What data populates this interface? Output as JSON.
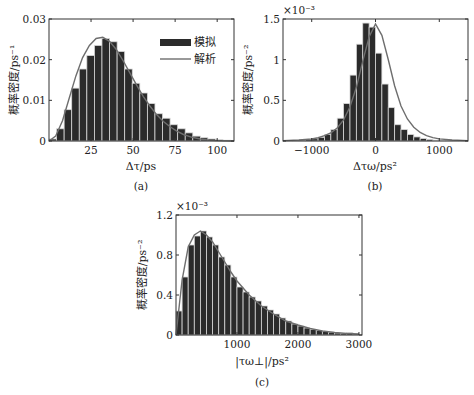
{
  "chart_data": [
    {
      "id": "a",
      "type": "bar",
      "caption": "(a)",
      "xlabel": "Δτ/ps",
      "ylabel": "概率密度/ps⁻¹",
      "xlim": [
        0,
        110
      ],
      "ylim": [
        0,
        0.03
      ],
      "xticks": [
        25,
        50,
        75,
        100
      ],
      "yticks": [
        0,
        0.01,
        0.02,
        0.03
      ],
      "ytick_labels": [
        "0",
        "0.01",
        "0.02",
        "0.03"
      ],
      "multiplier": "",
      "legend": [
        {
          "label": "模拟",
          "kind": "bar"
        },
        {
          "label": "解析",
          "kind": "line"
        }
      ],
      "bin_start": 0,
      "bin_width": 4.5,
      "values": [
        0.0005,
        0.003,
        0.0077,
        0.013,
        0.0177,
        0.021,
        0.0235,
        0.0252,
        0.0244,
        0.022,
        0.0177,
        0.0142,
        0.0118,
        0.0092,
        0.0067,
        0.0056,
        0.004,
        0.003,
        0.002,
        0.0012,
        0.0008,
        0.0005,
        0.0003,
        0.0002
      ],
      "curve": {
        "name": "解析",
        "x": [
          0,
          4,
          8,
          12,
          16,
          20,
          24,
          28,
          32,
          36,
          40,
          44,
          48,
          52,
          56,
          60,
          64,
          68,
          72,
          76,
          80,
          85,
          90,
          95,
          100,
          110
        ],
        "y": [
          0,
          0.0012,
          0.005,
          0.0105,
          0.016,
          0.0205,
          0.0235,
          0.0252,
          0.0255,
          0.0245,
          0.0225,
          0.0198,
          0.0168,
          0.0138,
          0.011,
          0.0086,
          0.0065,
          0.0048,
          0.0035,
          0.0024,
          0.0016,
          0.0009,
          0.0005,
          0.0002,
          0.0001,
          0
        ]
      }
    },
    {
      "id": "b",
      "type": "bar",
      "caption": "(b)",
      "xlabel": "Δτω/ps²",
      "ylabel": "概率密度/ps⁻²",
      "xlim": [
        -1450,
        1450
      ],
      "ylim": [
        0,
        1.5
      ],
      "xticks": [
        -1000,
        0,
        1000
      ],
      "yticks": [
        0,
        0.5,
        1,
        1.5
      ],
      "ytick_labels": [
        "0",
        "0.5",
        "1",
        "1.5"
      ],
      "multiplier": "×10⁻³",
      "bin_start": -1400,
      "bin_width": 100,
      "values": [
        0.005,
        0.008,
        0.012,
        0.018,
        0.028,
        0.045,
        0.08,
        0.14,
        0.28,
        0.46,
        0.81,
        1.19,
        1.45,
        1.4,
        1.08,
        0.7,
        0.41,
        0.2,
        0.14,
        0.08,
        0.05,
        0.03,
        0.02,
        0.01,
        0.007,
        0.005,
        0.003,
        0.002
      ],
      "curve": {
        "name": "解析",
        "x": [
          -1450,
          -1200,
          -1000,
          -900,
          -800,
          -700,
          -600,
          -500,
          -400,
          -300,
          -200,
          -100,
          0,
          100,
          200,
          300,
          400,
          500,
          600,
          700,
          800,
          900,
          1000,
          1200,
          1450
        ],
        "y": [
          0.005,
          0.012,
          0.025,
          0.04,
          0.065,
          0.1,
          0.16,
          0.26,
          0.42,
          0.66,
          0.98,
          1.28,
          1.44,
          1.3,
          1.0,
          0.68,
          0.43,
          0.27,
          0.17,
          0.105,
          0.067,
          0.042,
          0.026,
          0.012,
          0.005
        ]
      }
    },
    {
      "id": "c",
      "type": "bar",
      "caption": "(c)",
      "xlabel": "|τω⊥|/ps²",
      "ylabel": "概率密度/ps⁻²",
      "xlim": [
        0,
        3050
      ],
      "ylim": [
        0,
        1.2
      ],
      "xticks": [
        1000,
        2000,
        3000
      ],
      "yticks": [
        0,
        0.4,
        0.8,
        1.2
      ],
      "ytick_labels": [
        "0",
        "0.4",
        "0.8",
        "1.2"
      ],
      "multiplier": "×10⁻³",
      "bin_start": 0,
      "bin_width": 100,
      "values": [
        0.24,
        0.58,
        0.9,
        0.99,
        1.04,
        0.98,
        0.9,
        0.78,
        0.7,
        0.58,
        0.48,
        0.43,
        0.38,
        0.34,
        0.29,
        0.25,
        0.21,
        0.17,
        0.14,
        0.11,
        0.09,
        0.07,
        0.055,
        0.045,
        0.035,
        0.028,
        0.02,
        0.015,
        0.025,
        0.01
      ],
      "curve": {
        "name": "解析",
        "x": [
          0,
          100,
          200,
          300,
          400,
          500,
          600,
          700,
          800,
          900,
          1000,
          1200,
          1400,
          1600,
          1800,
          2000,
          2200,
          2400,
          2600,
          2800,
          3000
        ],
        "y": [
          0.0,
          0.55,
          0.88,
          1.0,
          1.04,
          1.0,
          0.93,
          0.83,
          0.73,
          0.63,
          0.54,
          0.4,
          0.29,
          0.21,
          0.14,
          0.1,
          0.065,
          0.04,
          0.025,
          0.015,
          0.01
        ]
      }
    }
  ],
  "figure": {
    "bar_color": "#2b2b2b",
    "bar_edge": "#d8d8d8",
    "curve_color": "#6e6e6e",
    "axis_color": "#333333"
  }
}
